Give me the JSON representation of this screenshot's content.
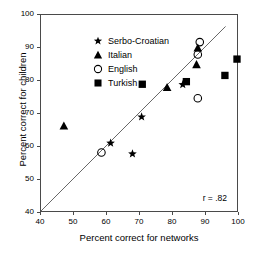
{
  "chart_data": {
    "type": "scatter",
    "title": "",
    "xlabel": "Percent correct for networks",
    "ylabel": "Percent correct for children",
    "xlim": [
      40,
      100
    ],
    "ylim": [
      40,
      100
    ],
    "xticks": [
      40,
      50,
      60,
      70,
      80,
      90,
      100
    ],
    "yticks": [
      40,
      50,
      60,
      70,
      80,
      90,
      100
    ],
    "grid": false,
    "legend_position": "upper-left",
    "annotations": [
      {
        "name": "correlation",
        "text": "r = .82"
      }
    ],
    "reference_line": {
      "name": "identity-line",
      "from": [
        40,
        40
      ],
      "to": [
        96.5,
        96.5
      ],
      "color": "#555555"
    },
    "series": [
      {
        "name": "Serbo-Croatian",
        "marker": "star",
        "filled": true,
        "color": "#000000",
        "points": [
          {
            "x": 61.3,
            "y": 60.8
          },
          {
            "x": 68.0,
            "y": 57.5
          },
          {
            "x": 70.8,
            "y": 68.8
          },
          {
            "x": 83.4,
            "y": 78.7
          }
        ]
      },
      {
        "name": "Italian",
        "marker": "triangle",
        "filled": true,
        "color": "#000000",
        "points": [
          {
            "x": 47.0,
            "y": 66.0
          },
          {
            "x": 78.6,
            "y": 77.8
          },
          {
            "x": 87.6,
            "y": 84.8
          },
          {
            "x": 88.0,
            "y": 89.9
          }
        ]
      },
      {
        "name": "English",
        "marker": "circle",
        "filled": false,
        "color": "#000000",
        "points": [
          {
            "x": 58.5,
            "y": 57.9
          },
          {
            "x": 88.0,
            "y": 74.5
          },
          {
            "x": 88.0,
            "y": 87.9
          },
          {
            "x": 88.6,
            "y": 91.7
          }
        ]
      },
      {
        "name": "Turkish",
        "marker": "square",
        "filled": true,
        "color": "#000000",
        "points": [
          {
            "x": 71.0,
            "y": 78.8
          },
          {
            "x": 84.5,
            "y": 79.6
          },
          {
            "x": 96.3,
            "y": 81.5
          },
          {
            "x": 100.0,
            "y": 86.5
          }
        ]
      }
    ]
  },
  "legend": {
    "items": [
      {
        "label": "Serbo-Croatian",
        "marker": "star"
      },
      {
        "label": "Italian",
        "marker": "triangle"
      },
      {
        "label": "English",
        "marker": "circle-open"
      },
      {
        "label": "Turkish",
        "marker": "square"
      }
    ]
  }
}
